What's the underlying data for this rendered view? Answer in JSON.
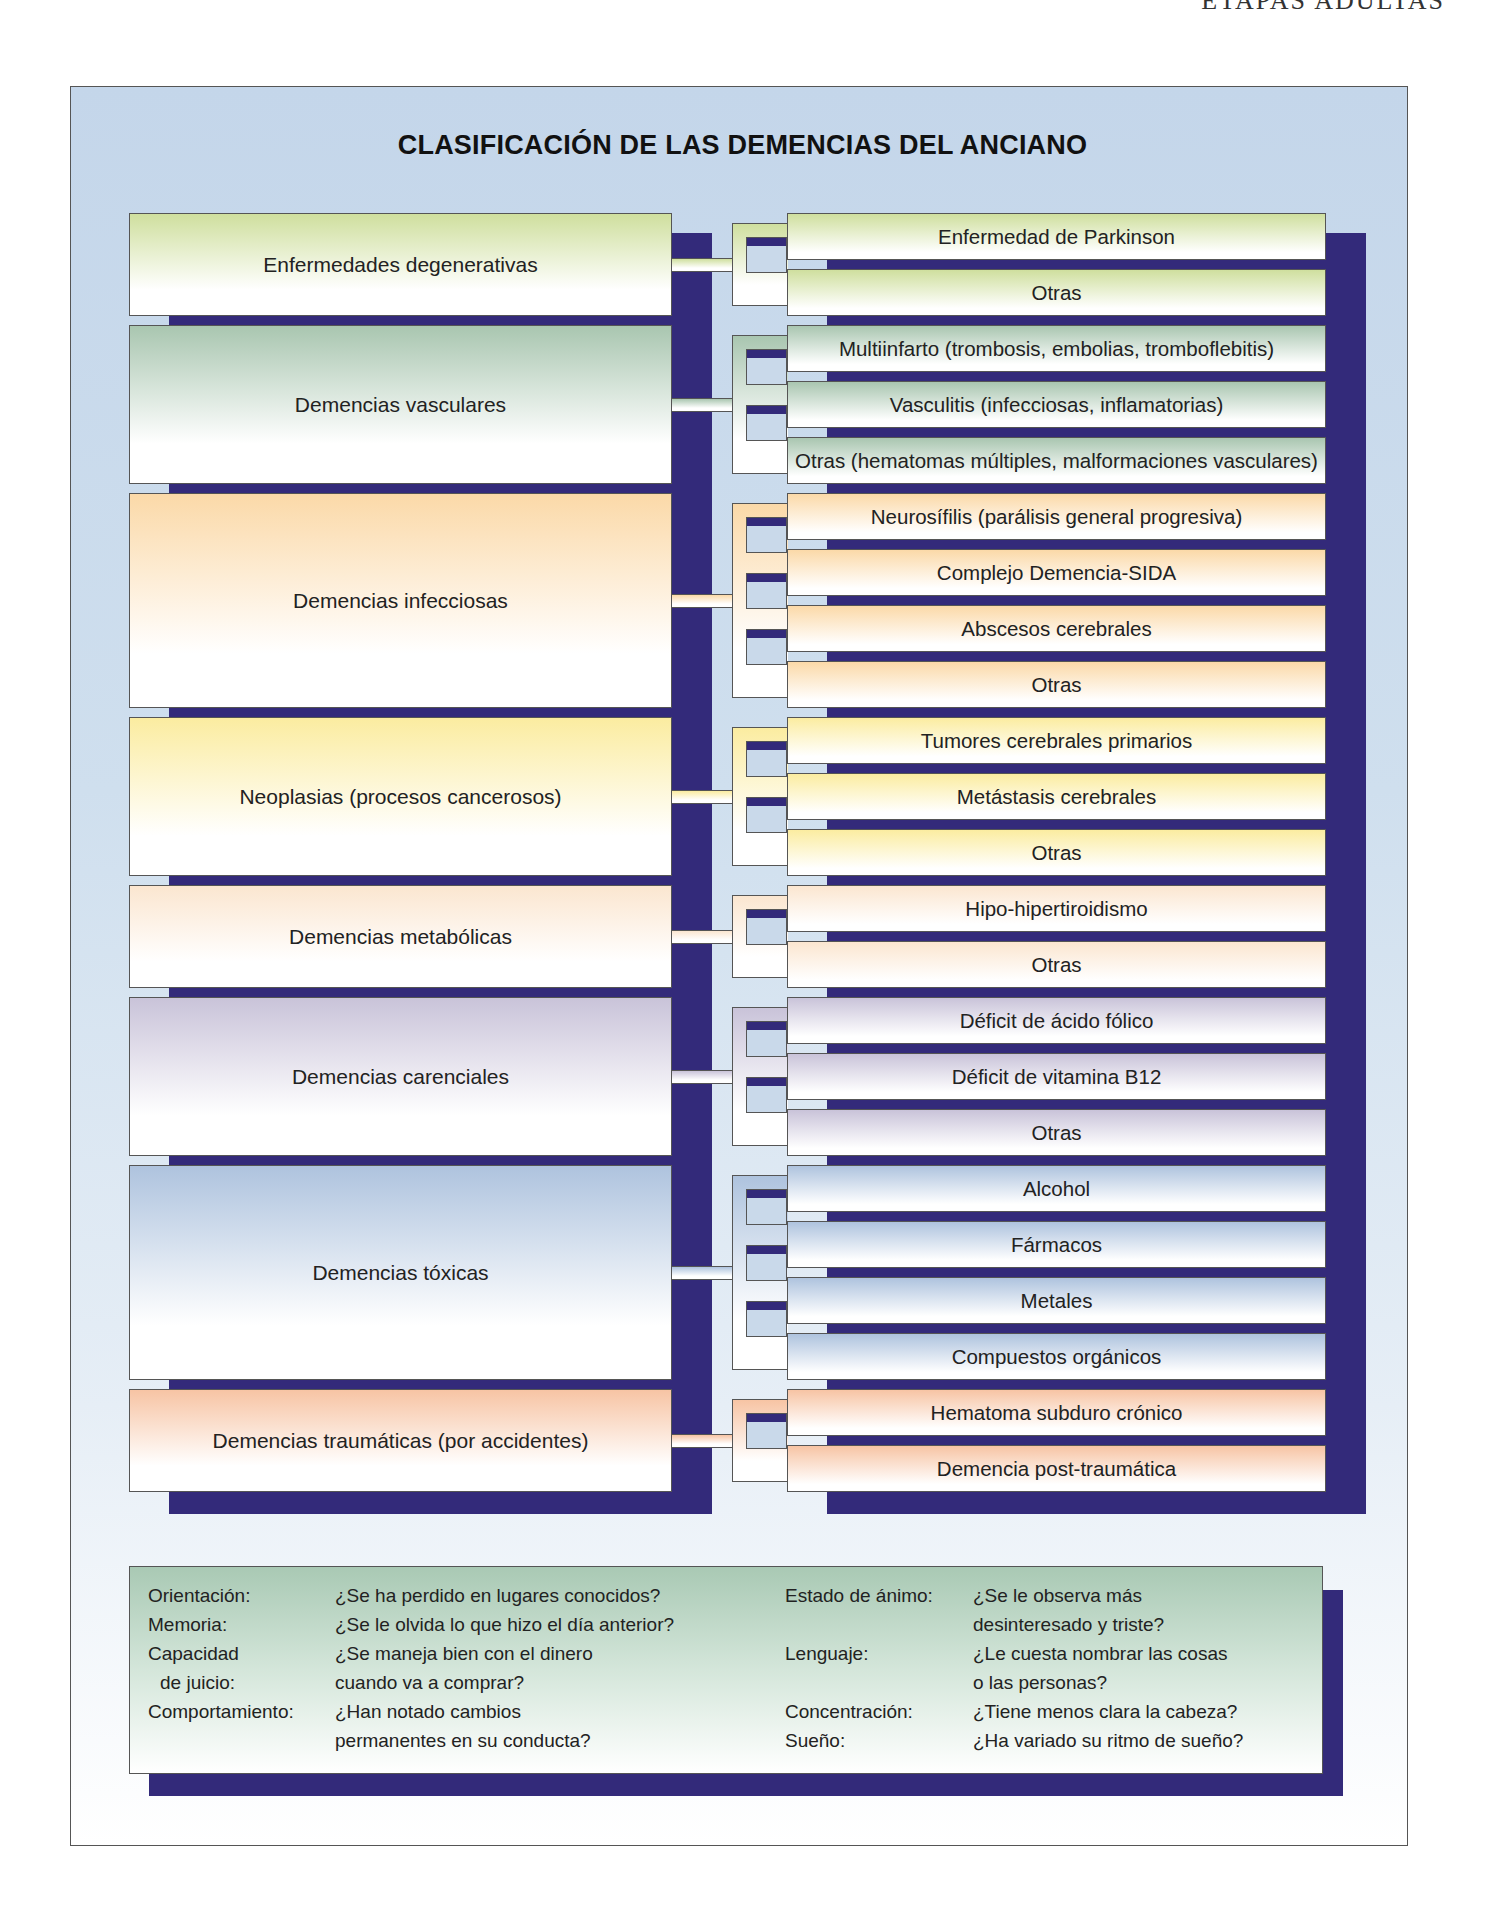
{
  "running_head": "ETAPAS ADULTAS",
  "title": "CLASIFICACIÓN DE LAS DEMENCIAS DEL ANCIANO",
  "colors": {
    "frame_bg": "#c4d6ea",
    "shadow": "#332a7a",
    "degenerativas": "#cfdf9e",
    "vasculares": "#a9c6b0",
    "infecciosas": "#fbd9a8",
    "neoplasias": "#fbeca0",
    "metabolicas": "#fbe6d0",
    "carenciales": "#c9c3d9",
    "toxicas": "#aec3de",
    "traumaticas": "#f7c4a4",
    "questions_bg": "#a9c9b4"
  },
  "categories": [
    {
      "label": "Enfermedades degenerativas",
      "items": [
        "Enfermedad de Parkinson",
        "Otras"
      ]
    },
    {
      "label": "Demencias vasculares",
      "items": [
        "Multiinfarto (trombosis, embolias, tromboflebitis)",
        "Vasculitis (infecciosas, inflamatorias)",
        "Otras (hematomas múltiples, malformaciones vasculares)"
      ]
    },
    {
      "label": "Demencias infecciosas",
      "items": [
        "Neurosífilis (parálisis general progresiva)",
        "Complejo Demencia-SIDA",
        "Abscesos cerebrales",
        "Otras"
      ]
    },
    {
      "label": "Neoplasias (procesos cancerosos)",
      "items": [
        "Tumores cerebrales primarios",
        "Metástasis cerebrales",
        "Otras"
      ]
    },
    {
      "label": "Demencias metabólicas",
      "items": [
        "Hipo-hipertiroidismo",
        "Otras"
      ]
    },
    {
      "label": "Demencias carenciales",
      "items": [
        "Déficit de ácido fólico",
        "Déficit de vitamina B12",
        "Otras"
      ]
    },
    {
      "label": "Demencias tóxicas",
      "items": [
        "Alcohol",
        "Fármacos",
        "Metales",
        "Compuestos orgánicos"
      ]
    },
    {
      "label": "Demencias traumáticas (por accidentes)",
      "items": [
        "Hematoma subduro crónico",
        "Demencia post-traumática"
      ]
    }
  ],
  "questions": {
    "left": [
      {
        "label": "Orientación:",
        "text": "¿Se ha perdido en lugares conocidos?"
      },
      {
        "label": "Memoria:",
        "text": "¿Se le olvida lo que hizo el día anterior?"
      },
      {
        "label": "Capacidad",
        "text": "¿Se maneja bien con el dinero"
      },
      {
        "label": "de juicio:",
        "text": "cuando va a comprar?"
      },
      {
        "label": "Comportamiento:",
        "text": "¿Han notado cambios"
      },
      {
        "label": "",
        "text": "permanentes en su conducta?"
      }
    ],
    "right": [
      {
        "label": "Estado de ánimo:",
        "text": "¿Se le observa más"
      },
      {
        "label": "",
        "text": "desinteresado y triste?"
      },
      {
        "label": "Lenguaje:",
        "text": "¿Le cuesta nombrar las cosas"
      },
      {
        "label": "",
        "text": "o las personas?"
      },
      {
        "label": "Concentración:",
        "text": "¿Tiene menos clara la cabeza?"
      },
      {
        "label": "Sueño:",
        "text": "¿Ha variado su ritmo de sueño?"
      }
    ]
  }
}
